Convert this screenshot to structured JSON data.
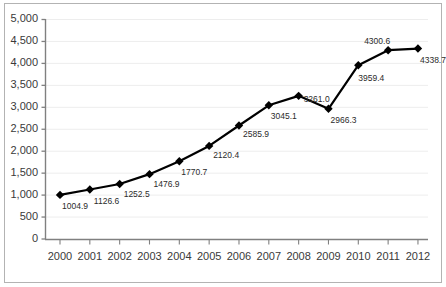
{
  "chart_data": {
    "type": "line",
    "title": "",
    "subtitle": "",
    "xlabel": "",
    "ylabel": "",
    "categories": [
      "2000",
      "2001",
      "2002",
      "2003",
      "2004",
      "2005",
      "2006",
      "2007",
      "2008",
      "2009",
      "2010",
      "2011",
      "2012"
    ],
    "values": [
      1004.9,
      1126.6,
      1252.5,
      1476.9,
      1770.7,
      2120.4,
      2585.9,
      3045.1,
      3261.0,
      2966.3,
      3959.4,
      4300.6,
      4338.7
    ],
    "point_labels": [
      "1004.9",
      "1126.6",
      "1252.5",
      "1476.9",
      "1770.7",
      "2120.4",
      "2585.9",
      "3045.1",
      "3261.0",
      "2966.3",
      "3959.4",
      "4300.6",
      "4338.7"
    ],
    "ylim": [
      0,
      5000
    ],
    "ytick_values": [
      0,
      500,
      1000,
      1500,
      2000,
      2500,
      3000,
      3500,
      4000,
      4500,
      5000
    ],
    "ytick_labels": [
      "0",
      "500",
      "1,000",
      "1,500",
      "2,000",
      "2,500",
      "3,000",
      "3,500",
      "4,000",
      "4,500",
      "5,000"
    ],
    "grid": true,
    "grid_axis": "y",
    "legend": false,
    "legend_position": "none",
    "series_color": "#000000",
    "grid_color": "#ededed",
    "axis_color": "#808080",
    "marker": "diamond",
    "series": [
      {
        "name": "",
        "values": [
          1004.9,
          1126.6,
          1252.5,
          1476.9,
          1770.7,
          2120.4,
          2585.9,
          3045.1,
          3261.0,
          2966.3,
          3959.4,
          4300.6,
          4338.7
        ]
      }
    ]
  },
  "colors": {
    "background": "#ffffff",
    "border": "#b3b3b3",
    "text": "#3a3a3a",
    "label_text": "#2b2b2b"
  }
}
